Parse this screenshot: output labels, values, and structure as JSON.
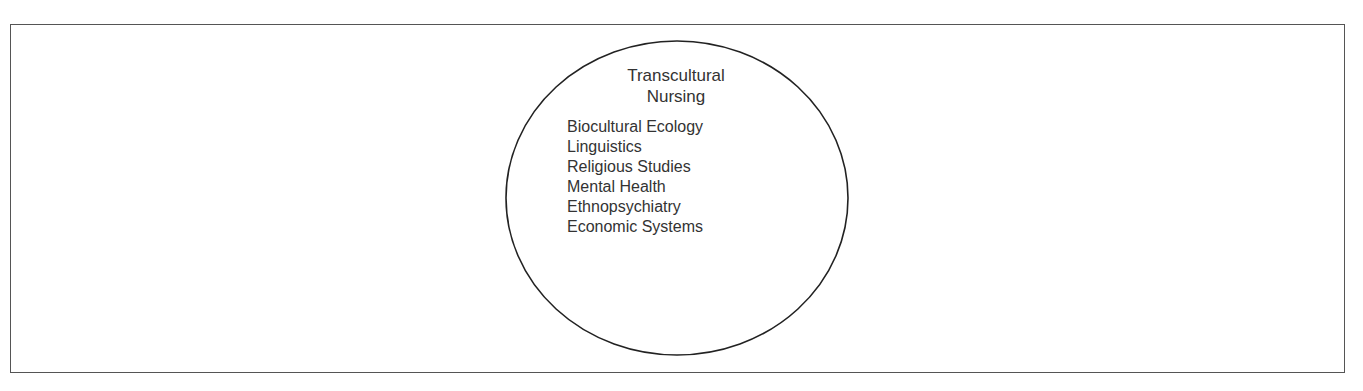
{
  "diagram": {
    "title_line1": "Transcultural",
    "title_line2": "Nursing",
    "items": [
      "Biocultural Ecology",
      "Linguistics",
      "Religious Studies",
      "Mental Health",
      "Ethnopsychiatry",
      "Economic Systems"
    ]
  }
}
